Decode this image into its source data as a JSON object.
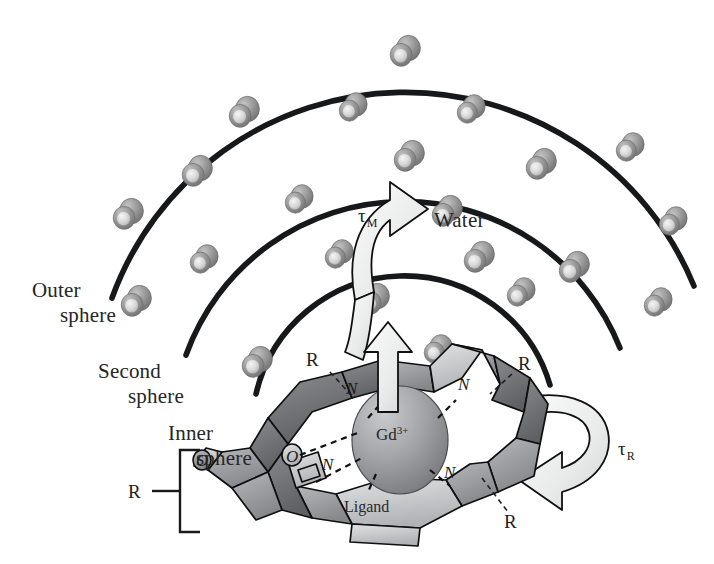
{
  "figure": {
    "background_color": "#ffffff",
    "width": 714,
    "height": 564
  },
  "labels": {
    "outer_sphere_line1": "Outer",
    "outer_sphere_line2": "sphere",
    "second_sphere_line1": "Second",
    "second_sphere_line2": "sphere",
    "inner_sphere_line1": "Inner",
    "inner_sphere_line2": "sphere",
    "water": "Water",
    "ligand": "Ligand",
    "tau_m": "τ",
    "tau_m_sub": "M",
    "tau_r": "τ",
    "tau_r_sub": "R",
    "metal": "Gd",
    "metal_charge": "3+",
    "r_left": "R",
    "r_top_left": "R",
    "r_top_right": "R",
    "r_bottom_right": "R",
    "nitrogen_1": "N",
    "nitrogen_2": "N",
    "nitrogen_3": "N",
    "nitrogen_4": "N",
    "oxygen_1": "O",
    "oxygen_2": "O"
  },
  "colors": {
    "arc_stroke": "#17181a",
    "text": "#262626",
    "water_oxygen_dark": "#7d7d7d",
    "water_oxygen_mid": "#9a9a9a",
    "water_hydrogen_light": "#dcdcdc",
    "cage_dark": "#6f7073",
    "cage_mid": "#9b9da0",
    "cage_light": "#c9cbcd",
    "gd_sphere": "#9ea0a3",
    "arrow_fill": "#eceded"
  },
  "spheres": [
    {
      "name": "inner-sphere",
      "radius": 152,
      "label": "Inner sphere"
    },
    {
      "name": "second-sphere",
      "radius": 232,
      "label": "Second sphere"
    },
    {
      "name": "outer-sphere",
      "radius": 312,
      "label": "Outer sphere"
    }
  ],
  "water_molecules": [
    {
      "x": 404,
      "y": 52,
      "r": 13
    },
    {
      "x": 243,
      "y": 113,
      "r": 13
    },
    {
      "x": 352,
      "y": 108,
      "r": 12
    },
    {
      "x": 470,
      "y": 110,
      "r": 12
    },
    {
      "x": 196,
      "y": 172,
      "r": 13
    },
    {
      "x": 408,
      "y": 157,
      "r": 13
    },
    {
      "x": 540,
      "y": 165,
      "r": 13
    },
    {
      "x": 629,
      "y": 148,
      "r": 12
    },
    {
      "x": 127,
      "y": 215,
      "r": 13
    },
    {
      "x": 298,
      "y": 200,
      "r": 12
    },
    {
      "x": 446,
      "y": 212,
      "r": 13
    },
    {
      "x": 672,
      "y": 222,
      "r": 12
    },
    {
      "x": 203,
      "y": 260,
      "r": 12
    },
    {
      "x": 338,
      "y": 255,
      "r": 12
    },
    {
      "x": 478,
      "y": 258,
      "r": 13
    },
    {
      "x": 573,
      "y": 268,
      "r": 13
    },
    {
      "x": 135,
      "y": 302,
      "r": 13
    },
    {
      "x": 373,
      "y": 300,
      "r": 13
    },
    {
      "x": 520,
      "y": 293,
      "r": 12
    },
    {
      "x": 657,
      "y": 303,
      "r": 12
    },
    {
      "x": 256,
      "y": 363,
      "r": 13
    },
    {
      "x": 437,
      "y": 350,
      "r": 12
    }
  ],
  "annotations": {
    "tau_m_meaning": "water exchange lifetime",
    "tau_r_meaning": "rotational correlation time"
  }
}
